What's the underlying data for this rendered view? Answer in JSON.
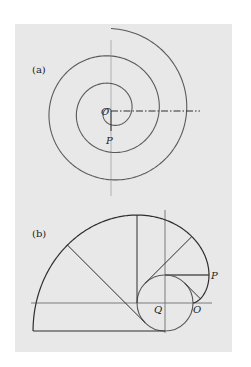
{
  "panel": {
    "x": 15,
    "y": 24,
    "width": 217,
    "height": 328,
    "color": "#e8e8e8"
  },
  "figure_a": {
    "label": "(a)",
    "label_pos": [
      32,
      73
    ],
    "center": [
      111,
      111
    ],
    "spiral": {
      "type": "archimedean",
      "growth_per_turn": 27.5,
      "turns": 3.0,
      "start_dir": "up",
      "direction": "counterclockwise"
    },
    "vertical_axis": {
      "x": 111,
      "y1": 40,
      "y2": 196
    },
    "dashdot_line": {
      "x1": 111,
      "x2": 200,
      "y": 111
    },
    "radius_segment": {
      "from": [
        111,
        111
      ],
      "to": [
        111,
        131
      ]
    },
    "points": {
      "O": {
        "text": "O",
        "pos": [
          101,
          115
        ]
      },
      "P": {
        "text": "P",
        "pos": [
          106,
          144
        ]
      }
    }
  },
  "figure_b": {
    "label": "(b)",
    "label_pos": [
      32,
      237
    ],
    "circle": {
      "cx": 165,
      "cy": 303,
      "r": 28
    },
    "involute": {
      "theta_start": 0,
      "theta_end": 4.71238898
    },
    "tangent_thetas": [
      0.7853982,
      1.5707963,
      2.3561945,
      3.1415927,
      3.9269908,
      4.71238898
    ],
    "heavy_tangent_index": 1,
    "vertical_axis": {
      "x": 165,
      "y1": 210,
      "y2": 333
    },
    "horizontal_axis": {
      "y": 303,
      "x1": 31,
      "x2": 212
    },
    "points": {
      "P": {
        "text": "P",
        "pos": [
          211,
          279
        ]
      },
      "Q": {
        "text": "Q",
        "pos": [
          154,
          313
        ]
      },
      "O": {
        "text": "O",
        "pos": [
          193,
          313
        ]
      }
    }
  }
}
